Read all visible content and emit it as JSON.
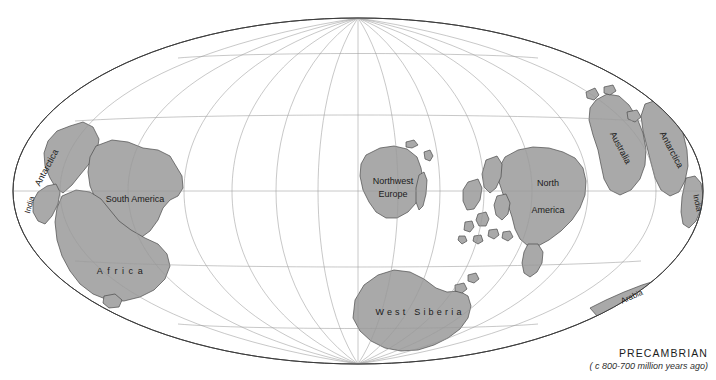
{
  "map": {
    "projection": "elliptical",
    "title": "PRECAMBRIAN",
    "subtitle": "( c 800-700 million years ago)",
    "colors": {
      "land_fill": "#a9a9a9",
      "land_stroke": "#4a4a4a",
      "graticule": "#9a9a9a",
      "outline": "#3c3c3c",
      "background": "#ffffff",
      "label_text": "#1b1b1b"
    },
    "graticule": {
      "meridian_interval_degrees": 30,
      "parallel_interval_degrees": 30,
      "visible": true
    },
    "labels": [
      {
        "name": "antarctica-left",
        "text": "Antarctica",
        "x": 47,
        "y": 168,
        "rotation": -62,
        "style": ""
      },
      {
        "name": "india-left",
        "text": "India",
        "x": 30,
        "y": 205,
        "rotation": -74,
        "style": "small"
      },
      {
        "name": "south-america",
        "text": "South America",
        "x": 135,
        "y": 200,
        "rotation": 0,
        "style": ""
      },
      {
        "name": "africa",
        "text": "Africa",
        "x": 120,
        "y": 272,
        "rotation": 0,
        "style": "wide"
      },
      {
        "name": "northwest-europe-line1",
        "text": "Northwest",
        "x": 393,
        "y": 182,
        "rotation": 0,
        "style": ""
      },
      {
        "name": "northwest-europe-line2",
        "text": "Europe",
        "x": 393,
        "y": 194,
        "rotation": 0,
        "style": ""
      },
      {
        "name": "north-america-line1",
        "text": "North",
        "x": 548,
        "y": 184,
        "rotation": 0,
        "style": ""
      },
      {
        "name": "north-america-line2",
        "text": "America",
        "x": 548,
        "y": 211,
        "rotation": 0,
        "style": ""
      },
      {
        "name": "west-siberia",
        "text": "West Siberia",
        "x": 418,
        "y": 313,
        "rotation": 0,
        "style": "spaced"
      },
      {
        "name": "australia",
        "text": "Australia",
        "x": 620,
        "y": 148,
        "rotation": 62,
        "style": ""
      },
      {
        "name": "antarctica-right",
        "text": "Antarctica",
        "x": 671,
        "y": 150,
        "rotation": 62,
        "style": ""
      },
      {
        "name": "india-right",
        "text": "India",
        "x": 697,
        "y": 203,
        "rotation": 78,
        "style": "small"
      },
      {
        "name": "arabia",
        "text": "Arabia",
        "x": 632,
        "y": 297,
        "rotation": -24,
        "style": "small"
      }
    ],
    "landmass_names": [
      "Antarctica",
      "India",
      "South America",
      "Africa",
      "Northwest Europe",
      "North America",
      "West Siberia",
      "Australia",
      "Arabia"
    ]
  }
}
